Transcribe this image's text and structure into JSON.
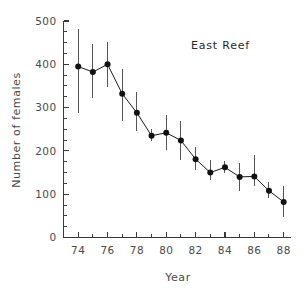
{
  "chart_data": {
    "type": "line",
    "title": "East Reef",
    "xlabel": "Year",
    "ylabel": "Number of females",
    "xlim": [
      73,
      88.5
    ],
    "ylim": [
      0,
      500
    ],
    "grid": false,
    "legend": "none",
    "x_major_ticks": [
      74,
      76,
      78,
      80,
      82,
      84,
      86,
      88
    ],
    "x_major_tick_labels": [
      "74",
      "76",
      "78",
      "80",
      "82",
      "84",
      "86",
      "88"
    ],
    "x_minor_ticks": [
      75,
      77,
      79,
      81,
      83,
      85,
      87
    ],
    "y_major_ticks": [
      0,
      100,
      200,
      300,
      400,
      500
    ],
    "y_major_tick_labels": [
      "0",
      "100",
      "200",
      "300",
      "400",
      "500"
    ],
    "y_minor_tick_step": 25,
    "marker": "filled-circle",
    "errorbars": true,
    "x": [
      74,
      75,
      76,
      77,
      78,
      79,
      80,
      81,
      82,
      83,
      84,
      85,
      86,
      87,
      88
    ],
    "values": [
      395,
      382,
      400,
      332,
      288,
      235,
      242,
      224,
      181,
      150,
      162,
      140,
      141,
      108,
      82
    ],
    "error_low": [
      288,
      322,
      348,
      268,
      246,
      222,
      202,
      178,
      155,
      132,
      148,
      108,
      118,
      92,
      48
    ],
    "error_high": [
      481,
      447,
      452,
      388,
      335,
      250,
      282,
      270,
      208,
      178,
      176,
      172,
      190,
      128,
      118
    ],
    "series": [
      {
        "name": "East Reef",
        "values": [
          395,
          382,
          400,
          332,
          288,
          235,
          242,
          224,
          181,
          150,
          162,
          140,
          141,
          108,
          82
        ]
      }
    ],
    "colors": {
      "marker": "#111111",
      "line": "#1a1a1a",
      "errorbar": "#555555",
      "axis": "#3a3a3a",
      "text": "#4a4a4a",
      "background": "#ffffff"
    }
  }
}
